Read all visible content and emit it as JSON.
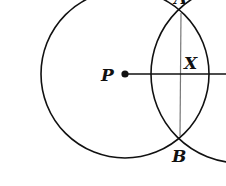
{
  "diagram": {
    "type": "geometric-construction",
    "colors": {
      "stroke": "#111111",
      "chord": "#777777",
      "background": "#ffffff"
    },
    "points": {
      "P": {
        "label": "P",
        "x": 125,
        "y": 74
      },
      "X": {
        "label": "X",
        "x": 181,
        "y": 74
      },
      "A": {
        "label": "A",
        "x": 181,
        "y": 13
      },
      "B": {
        "label": "B",
        "x": 180,
        "y": 136
      }
    },
    "circles": [
      {
        "name": "circle-P",
        "cx": 125,
        "cy": 74,
        "r": 84
      },
      {
        "name": "circle-right",
        "cx": 240,
        "cy": 74,
        "r": 89
      }
    ],
    "labels": {
      "P": "P",
      "X": "X",
      "B": "B",
      "A": "A"
    }
  }
}
